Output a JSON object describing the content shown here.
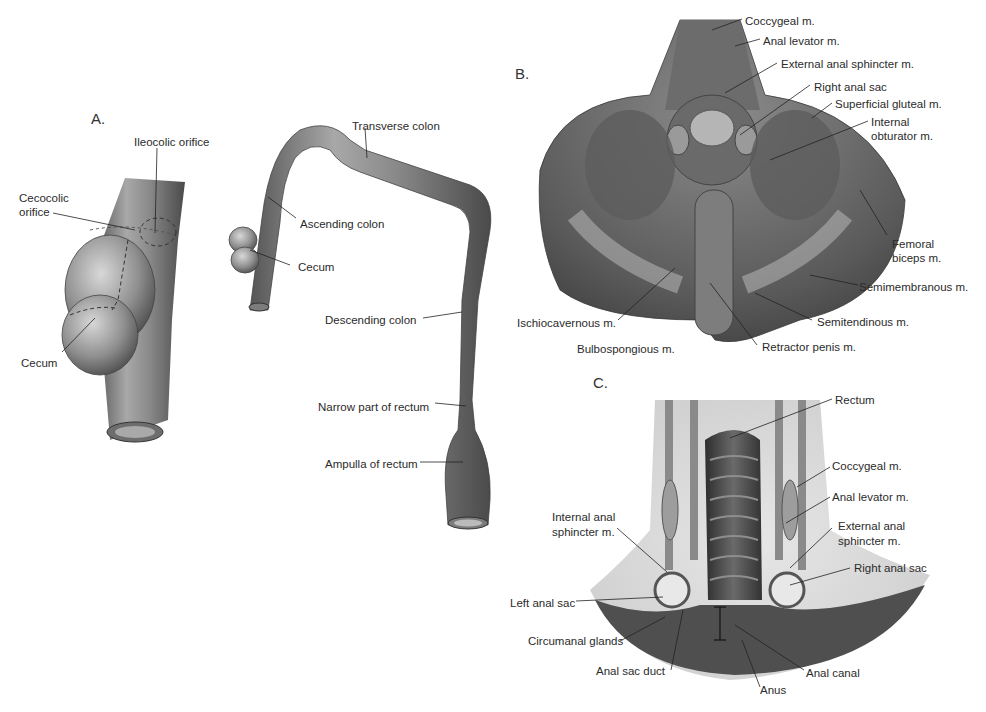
{
  "figure": {
    "panels": [
      {
        "id": "A",
        "letter": "A.",
        "labels": {
          "ileocolic_orifice": "Ileocolic orifice",
          "cecocolic_orifice_1": "Cecocolic",
          "cecocolic_orifice_2": "orifice",
          "cecum_detail": "Cecum",
          "transverse_colon": "Transverse colon",
          "ascending_colon": "Ascending colon",
          "cecum": "Cecum",
          "descending_colon": "Descending colon",
          "narrow_part_rectum": "Narrow part of rectum",
          "ampulla_rectum": "Ampulla of rectum"
        }
      },
      {
        "id": "B",
        "letter": "B.",
        "labels": {
          "coccygeal": "Coccygeal m.",
          "anal_levator": "Anal levator m.",
          "external_anal_sphincter": "External anal sphincter m.",
          "right_anal_sac": "Right anal sac",
          "superficial_gluteal": "Superficial gluteal m.",
          "internal_obturator_1": "Internal",
          "internal_obturator_2": "obturator m.",
          "femoral_biceps_1": "Femoral",
          "femoral_biceps_2": "biceps m.",
          "semimembranous": "Semimembranous m.",
          "semitendinous": "Semitendinous m.",
          "retractor_penis": "Retractor penis m.",
          "bulbospongious": "Bulbospongious m.",
          "ischiocavernous": "Ischiocavernous m."
        }
      },
      {
        "id": "C",
        "letter": "C.",
        "labels": {
          "rectum": "Rectum",
          "coccygeal": "Coccygeal m.",
          "anal_levator": "Anal levator m.",
          "external_anal_sphincter_1": "External anal",
          "external_anal_sphincter_2": "sphincter m.",
          "right_anal_sac": "Right anal sac",
          "internal_anal_sphincter_1": "Internal anal",
          "internal_anal_sphincter_2": "sphincter m.",
          "left_anal_sac": "Left anal sac",
          "circumanal_glands": "Circumanal glands",
          "anal_sac_duct": "Anal sac duct",
          "anus": "Anus",
          "anal_canal": "Anal canal"
        }
      }
    ],
    "colors": {
      "tissue_dark": "#4a4a4a",
      "tissue_mid": "#7a7a7a",
      "tissue_light": "#bdbdbd",
      "label_text": "#2b2b2b",
      "leader_line": "#222222",
      "background": "#ffffff"
    }
  }
}
